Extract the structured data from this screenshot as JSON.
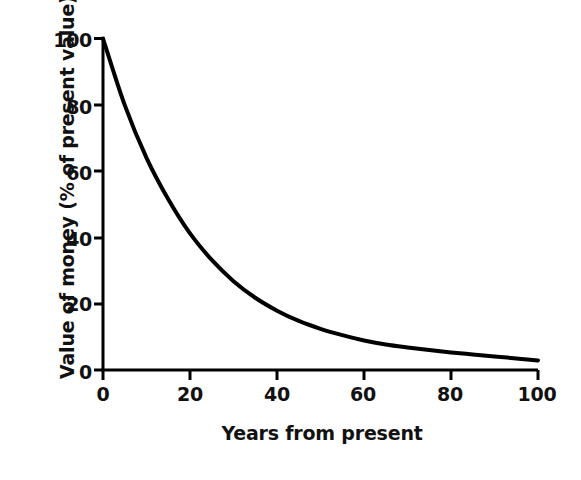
{
  "chart_data": {
    "type": "line",
    "title": "",
    "xlabel": "Years from present",
    "ylabel": "Value of money (% of present value)",
    "xlim": [
      0,
      100
    ],
    "ylim": [
      0,
      100
    ],
    "xticks": [
      0,
      20,
      40,
      60,
      80,
      100
    ],
    "yticks": [
      0,
      20,
      40,
      60,
      80,
      100
    ],
    "xtick_labels": [
      "0",
      "20",
      "40",
      "60",
      "80",
      "100"
    ],
    "ytick_labels": [
      "0",
      "20",
      "40",
      "60",
      "80",
      "100"
    ],
    "grid": false,
    "legend": null,
    "series": [
      {
        "name": "Discounted value of money",
        "x": [
          0,
          5,
          10,
          15,
          20,
          25,
          30,
          35,
          40,
          45,
          50,
          55,
          60,
          65,
          70,
          75,
          80,
          85,
          90,
          95,
          100
        ],
        "values": [
          100,
          79.9,
          64.0,
          51.5,
          41.2,
          33.2,
          26.8,
          21.8,
          17.9,
          14.8,
          12.4,
          10.5,
          8.9,
          7.7,
          6.8,
          6.0,
          5.3,
          4.7,
          4.1,
          3.5,
          2.9
        ]
      }
    ],
    "annotations": [],
    "line_color": "#000000",
    "line_width_px": 4,
    "axis_color": "#000000",
    "background_color": "#ffffff"
  },
  "figure": {
    "xlabel_text": "Years from present",
    "ylabel_text": "Value of money (% of present value)",
    "ytick_labels": [
      "100",
      "80",
      "60",
      "40",
      "20",
      "0"
    ],
    "xtick_labels": [
      "0",
      "20",
      "40",
      "60",
      "80",
      "100"
    ]
  }
}
